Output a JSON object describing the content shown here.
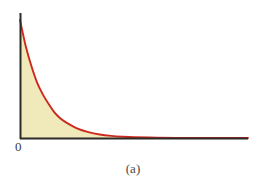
{
  "figure": {
    "caption": "(a)",
    "origin_label": "0",
    "background_color": "#ffffff"
  },
  "colors": {
    "curve": "#cc2a1e",
    "fill": "#f0e9b9",
    "axis": "#2b2b28",
    "text": "#3a3a36"
  },
  "chart_data": {
    "type": "area",
    "title": "",
    "subtitle": "",
    "xlabel": "",
    "ylabel": "",
    "caption": "(a)",
    "grid": false,
    "legend": null,
    "axis_style": "two-axis-no-ticks",
    "tick_labels": {
      "x": [
        "0"
      ],
      "y": []
    },
    "xlim": [
      0,
      10
    ],
    "ylim": [
      0,
      1
    ],
    "series": [
      {
        "name": "exponential-decay",
        "color": "#cc2a1e",
        "filled": true,
        "fill_color": "#f0e9b9",
        "x": [
          0,
          0.25,
          0.5,
          0.75,
          1,
          1.25,
          1.5,
          1.75,
          2,
          2.5,
          3,
          3.5,
          4,
          4.5,
          5,
          6,
          7,
          8,
          9,
          10
        ],
        "y": [
          1.0,
          0.78,
          0.61,
          0.47,
          0.37,
          0.29,
          0.22,
          0.17,
          0.135,
          0.082,
          0.05,
          0.03,
          0.018,
          0.011,
          0.0067,
          0.0025,
          0.0009,
          0.0003,
          0.0001,
          0.0
        ]
      }
    ]
  },
  "geometry": {
    "axis_x_px": 20,
    "axis_y_px": 138,
    "axis_top_px": 13,
    "axis_right_px": 248,
    "curve_start_y_px": 20
  }
}
